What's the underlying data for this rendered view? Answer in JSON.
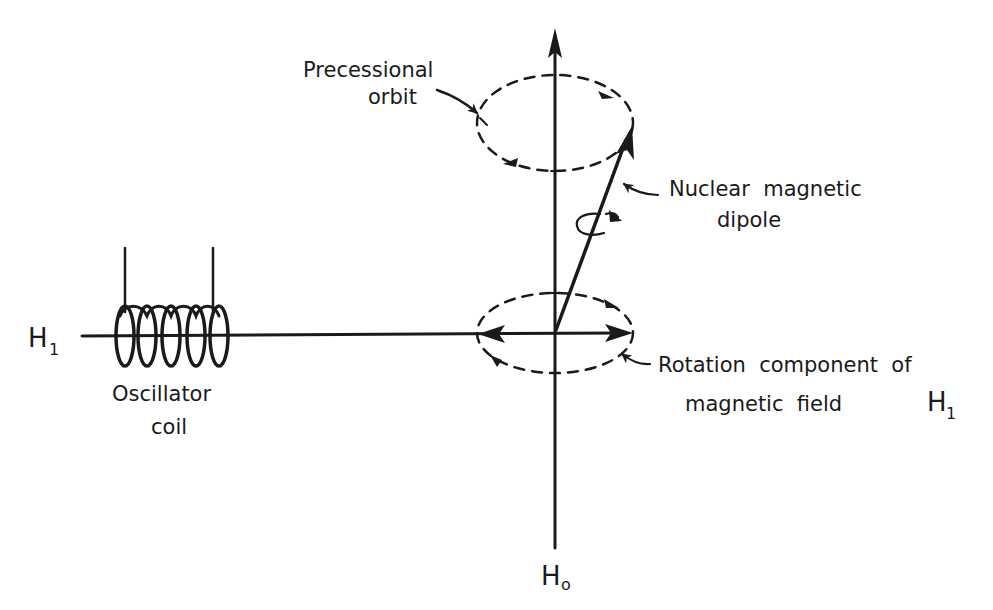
{
  "diagram": {
    "colors": {
      "ink": "#1a1a1a",
      "background": "#ffffff"
    },
    "labels": {
      "precessional_orbit": {
        "line1": "Precessional",
        "line2": "orbit"
      },
      "nuclear_dipole": {
        "line1": "Nuclear  magnetic",
        "line2": "dipole"
      },
      "rotation_component": {
        "line1": "Rotation  component  of",
        "line2": "magnetic  field",
        "symbol": "H",
        "subscript": "1"
      },
      "oscillator_coil": {
        "line1": "Oscillator",
        "line2": "coil"
      },
      "h1_axis": {
        "symbol": "H",
        "subscript": "1"
      },
      "h0_axis": {
        "symbol": "H",
        "subscript": "o"
      }
    },
    "elements": [
      "vertical-axis-H0",
      "horizontal-axis-H1",
      "upper-precessional-orbit",
      "lower-rotation-ellipse",
      "nuclear-dipole-vector",
      "spin-arrow",
      "oscillator-coil"
    ]
  }
}
